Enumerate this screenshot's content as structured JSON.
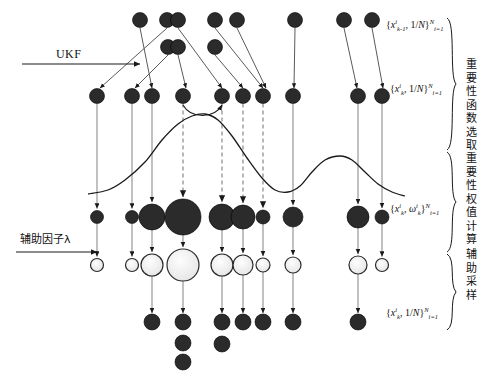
{
  "figure": {
    "background": "#ffffff",
    "ink_color": "#1a1a1a",
    "dashed_color": "#9a9a9a",
    "node_fill_dark": "#2b2b2b",
    "node_fill_light": "#eeeeee"
  },
  "left_labels": [
    {
      "id": "ukf",
      "text": "UKF",
      "x": 56,
      "y": 54,
      "arrow_from_x": 22,
      "arrow_to_x": 140,
      "arrow_y": 64
    },
    {
      "id": "aux-factor",
      "text": "辅助因子λ",
      "x": 20,
      "y": 236,
      "arrow_from_x": 16,
      "arrow_to_x": 97,
      "arrow_y": 252
    }
  ],
  "math_labels": [
    {
      "id": "prior-particles",
      "x": 386,
      "y": 24,
      "base": "{x",
      "sup": "i",
      "sub": "k-1",
      "mid": ", 1/N}",
      "rsup": "N",
      "rsub": "i=1"
    },
    {
      "id": "predicted-particles",
      "x": 390,
      "y": 88,
      "base": "{x",
      "sup": "i",
      "sub": "k",
      "mid": ", 1/N}",
      "rsup": "N",
      "rsub": "i=1"
    },
    {
      "id": "weighted-particles",
      "x": 390,
      "y": 208,
      "base": "{x",
      "sup": "i",
      "sub": "k",
      "mid": ", ω",
      "mid_sup": "i",
      "mid_sub": "k",
      "mid2": "}",
      "rsup": "N",
      "rsub": "i=1"
    },
    {
      "id": "resampled-particles",
      "x": 386,
      "y": 312,
      "base": "{x",
      "sup": "i",
      "sub": "k",
      "mid": ", 1/N}",
      "rsup": "N",
      "rsub": "i=1"
    }
  ],
  "stage_labels": [
    {
      "id": "importance-function-selection",
      "text": "重要性函数选取",
      "x": 462,
      "y": 62,
      "brace_top": 18,
      "brace_bottom": 150
    },
    {
      "id": "importance-weight-computation",
      "text": "重要性权值计算",
      "x": 462,
      "y": 152,
      "brace_top": 152,
      "brace_bottom": 252
    },
    {
      "id": "auxiliary-sampling",
      "text": "辅助采样",
      "x": 462,
      "y": 250,
      "brace_top": 254,
      "brace_bottom": 330
    }
  ],
  "rows": {
    "top_a": {
      "id": "row-prior-top",
      "y": 20,
      "r": 7.5,
      "fill": "dark",
      "x": [
        167,
        140,
        178,
        215,
        237,
        295,
        344,
        372
      ]
    },
    "top_b": {
      "id": "row-prior-second",
      "y": 47,
      "r": 7.5,
      "fill": "dark",
      "x": [
        168,
        178,
        215
      ]
    },
    "predict": {
      "id": "row-predicted",
      "y": 96,
      "r": 7.5,
      "fill": "dark",
      "x": [
        97,
        132,
        152,
        183,
        222,
        243,
        263,
        293,
        358,
        382
      ]
    },
    "weights": {
      "id": "row-weighted",
      "y": 217,
      "fill": "dark",
      "x": [
        97,
        132,
        152,
        183,
        222,
        243,
        263,
        293,
        358,
        382
      ],
      "radii": [
        6.5,
        6.5,
        13,
        18,
        13,
        12,
        7,
        10,
        11,
        7
      ]
    },
    "aux": {
      "id": "row-auxiliary",
      "y": 265,
      "fill": "light",
      "x": [
        97,
        132,
        152,
        183,
        222,
        243,
        263,
        293,
        358,
        382
      ],
      "radii": [
        6.5,
        6.5,
        11,
        16,
        11,
        10,
        7,
        8,
        9,
        6.5
      ]
    },
    "resample": {
      "id": "row-resampled",
      "y": 322,
      "r": 8,
      "fill": "dark",
      "x": [
        152,
        183,
        222,
        243,
        263,
        293,
        358
      ],
      "extra": [
        {
          "x": 183,
          "y": 343
        },
        {
          "x": 183,
          "y": 362
        },
        {
          "x": 222,
          "y": 344
        }
      ]
    }
  },
  "curve": {
    "id": "importance-density-curve",
    "description": "bimodal importance density",
    "baseline_y": 196,
    "points": [
      [
        88,
        194
      ],
      [
        108,
        190
      ],
      [
        125,
        180
      ],
      [
        145,
        162
      ],
      [
        162,
        140
      ],
      [
        178,
        124
      ],
      [
        192,
        116
      ],
      [
        205,
        114
      ],
      [
        218,
        120
      ],
      [
        232,
        136
      ],
      [
        247,
        158
      ],
      [
        262,
        178
      ],
      [
        275,
        190
      ],
      [
        288,
        192
      ],
      [
        300,
        186
      ],
      [
        312,
        172
      ],
      [
        325,
        160
      ],
      [
        340,
        156
      ],
      [
        352,
        160
      ],
      [
        365,
        172
      ],
      [
        378,
        184
      ],
      [
        392,
        192
      ],
      [
        405,
        196
      ]
    ]
  },
  "arrows": {
    "ukf_fan": [
      {
        "from": [
          167,
          28
        ],
        "to": [
          100,
          88
        ]
      },
      {
        "from": [
          168,
          55
        ],
        "to": [
          135,
          88
        ]
      },
      {
        "from": [
          140,
          28
        ],
        "to": [
          152,
          88
        ]
      },
      {
        "from": [
          178,
          55
        ],
        "to": [
          186,
          88
        ]
      },
      {
        "from": [
          178,
          28
        ],
        "to": [
          222,
          88
        ]
      },
      {
        "from": [
          215,
          55
        ],
        "to": [
          243,
          88
        ]
      },
      {
        "from": [
          215,
          28
        ],
        "to": [
          263,
          88
        ]
      },
      {
        "from": [
          237,
          28
        ],
        "to": [
          266,
          88
        ]
      },
      {
        "from": [
          295,
          28
        ],
        "to": [
          294,
          88
        ]
      },
      {
        "from": [
          344,
          28
        ],
        "to": [
          357,
          88
        ]
      },
      {
        "from": [
          372,
          28
        ],
        "to": [
          383,
          88
        ]
      }
    ],
    "solid_down_x": [
      97,
      132,
      152,
      293,
      358,
      382
    ],
    "dashed_down_x": [
      183,
      222,
      243,
      263
    ],
    "curve_hook": {
      "from": [
        183,
        105
      ],
      "to": [
        222,
        105
      ]
    }
  }
}
